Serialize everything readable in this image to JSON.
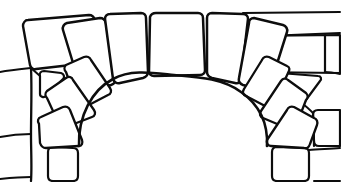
{
  "figure": {
    "width": 341,
    "height": 182,
    "background_color": "#ffffff",
    "stroke_color": "#0d0d0d",
    "stroke_width": 2.1,
    "medium": "pen-and-ink line art"
  },
  "shapes": {
    "arch_voussoirs": [
      {
        "name": "voussoir-keystone",
        "label": "keystone",
        "position": "top-center",
        "path": "M150 17 C151 14 153 13 156 13 L198 13 C201 13 203 15 203 18 L205 70 C205 73 203 75 200 75 L154 76 C151 76 149 74 149 71 Z"
      },
      {
        "name": "voussoir-left-1",
        "label": "upper-left voussoir",
        "position": "top-left-of-keystone",
        "path": "M105 19 C105 16 107 14 110 14 L141 13 C144 13 146 15 146 18 L148 72 C148 75 146 77 143 78 L120 83 C117 84 114 82 113 79 Z"
      },
      {
        "name": "voussoir-left-2",
        "label": "second-left voussoir",
        "position": "upper-left-haunch",
        "path": "M63 30 C62 27 64 24 67 23 L100 18 C103 18 105 20 106 23 L115 79 C116 82 114 84 111 85 L87 90 C84 91 81 89 80 86 Z"
      },
      {
        "name": "voussoir-left-3",
        "label": "third-left voussoir",
        "position": "left-haunch",
        "path": "M66 72 C64 70 64 67 66 65 L84 57 C87 56 90 57 91 60 L110 88 C112 91 111 94 108 95 L85 107 C82 109 79 108 78 105 Z"
      },
      {
        "name": "voussoir-left-4",
        "label": "fourth-left voussoir",
        "position": "lower-left-haunch",
        "path": "M47 98 C45 96 45 93 47 91 L66 78 C69 76 72 77 73 80 L94 110 C96 113 95 116 92 117 L66 127 C63 128 60 127 59 124 Z"
      },
      {
        "name": "voussoir-left-5",
        "label": "left springer",
        "position": "left-spring-line",
        "path": "M39 124 C37 121 38 118 41 117 L63 107 C66 106 69 107 70 110 L82 140 C83 143 82 146 79 146 L46 148 C43 148 41 146 40 143 Z"
      },
      {
        "name": "voussoir-right-1",
        "label": "upper-right voussoir",
        "position": "top-right-of-keystone",
        "path": "M207 18 C207 15 209 13 212 13 L243 14 C246 14 248 16 248 19 L241 79 C240 82 238 84 235 83 L212 78 C209 77 207 75 207 72 Z"
      },
      {
        "name": "voussoir-right-2",
        "label": "second-right voussoir",
        "position": "upper-right-haunch",
        "path": "M249 23 C249 20 251 18 254 18 L283 25 C286 26 288 29 287 32 L270 86 C269 89 266 91 263 90 L243 85 C240 84 238 81 239 78 Z"
      },
      {
        "name": "voussoir-right-3",
        "label": "third-right voussoir",
        "position": "right-haunch",
        "path": "M262 60 C263 57 266 56 269 57 L287 66 C290 67 290 70 288 73 L274 104 C273 107 270 108 267 107 L246 96 C243 95 242 92 244 89 Z"
      },
      {
        "name": "voussoir-right-4",
        "label": "fourth-right voussoir",
        "position": "lower-right-haunch",
        "path": "M281 81 C283 78 286 78 288 80 L306 93 C308 95 308 98 306 100 L296 126 C295 129 292 130 289 129 L263 118 C260 117 259 114 261 111 Z"
      },
      {
        "name": "voussoir-right-5",
        "label": "right springer",
        "position": "right-spring-line",
        "path": "M287 110 C288 107 291 106 294 107 L314 118 C317 119 318 122 317 125 L310 144 C309 147 307 149 304 148 L271 146 C268 146 266 143 267 140 Z"
      }
    ],
    "wall_stones_left": [
      {
        "name": "wall-stone-left-large-top",
        "label": "large upper-left block",
        "path": "M23 26 C23 23 25 20 28 20 L89 15 C92 15 94 17 95 20 L101 55 C102 58 100 61 97 62 L36 69 C33 70 31 68 30 65 Z"
      },
      {
        "name": "wall-stone-left-triangle",
        "label": "small left triangular stone",
        "path": "M40 76 C39 73 41 71 44 71 L61 73 C64 74 65 77 63 79 L46 96 C44 98 40 97 40 94 Z"
      },
      {
        "name": "wall-stone-left-bottom-square",
        "label": "lower-left square stone",
        "path": "M48 152 C48 149 50 147 53 147 L73 148 C76 148 78 150 78 153 L78 176 C78 179 76 181 73 181 L53 181 C50 181 48 179 48 176 Z"
      }
    ],
    "wall_stones_right": [
      {
        "name": "wall-stone-right-top-course",
        "label": "upper-right horizontal course",
        "path": "M243 13 L340 12"
      },
      {
        "name": "wall-stone-right-block-1",
        "label": "right upper block",
        "path": "M242 37 L340 33"
      },
      {
        "name": "wall-stone-right-block-2",
        "label": "right block below course",
        "path": "M244 40 C244 38 246 36 249 36 L340 35 L340 73 L253 72 C250 72 248 70 248 67 Z"
      },
      {
        "name": "wall-stone-right-triangle",
        "label": "right downward triangular stone",
        "path": "M276 78 C275 75 277 73 280 73 L318 76 C321 76 322 79 320 81 L303 104 C301 107 297 107 296 104 Z"
      },
      {
        "name": "wall-stone-right-block-3",
        "label": "right lower block",
        "path": "M313 115 C313 112 315 110 318 110 L340 110 L340 146 L319 146 C316 146 314 144 314 141 Z"
      },
      {
        "name": "wall-stone-right-bottom",
        "label": "lower-right wide stone",
        "path": "M272 152 C272 149 274 147 277 147 L304 148 C307 148 309 150 309 153 L309 176 C309 179 307 181 304 181 L277 181 C274 181 272 179 272 176 Z"
      }
    ],
    "mortar_lines": [
      {
        "name": "mortar-line-left-vertical",
        "label": "left vertical mortar joint",
        "path": "M31 68 C32 90 31 112 31 134 C31 152 32 167 31 181"
      },
      {
        "name": "mortar-line-left-upper-horizontal",
        "label": "left upper horizontal joint",
        "path": "M0 72 C10 70 21 69 31 68"
      },
      {
        "name": "mortar-line-left-lower-horizontal",
        "label": "left lower horizontal joint",
        "path": "M0 137 C10 135 21 134 31 134"
      },
      {
        "name": "mortar-line-left-bottom-horizontal",
        "label": "left bottom horizontal joint",
        "path": "M0 179 C10 178 21 177 31 177"
      },
      {
        "name": "mortar-line-left-triangle-joint",
        "label": "joint from triangle to arch",
        "path": "M40 76 L31 68"
      },
      {
        "name": "mortar-line-right-vertical-upper",
        "label": "right upper vertical joint",
        "path": "M325 35 C325 48 325 60 325 72"
      },
      {
        "name": "mortar-line-right-vertical-lower",
        "label": "right lower vertical joint",
        "path": "M313 113 C314 128 314 142 314 146"
      },
      {
        "name": "mortar-line-right-bottom-horizontal",
        "label": "right bottom horizontal joint",
        "path": "M309 150 C318 149 329 149 340 148"
      },
      {
        "name": "mortar-line-right-upper-edge",
        "label": "right edge upper joint",
        "path": "M325 72 C330 72 335 73 340 74"
      },
      {
        "name": "mortar-line-right-tri-joint",
        "label": "joint between triangle and lower block",
        "path": "M303 104 C307 107 310 110 313 113"
      },
      {
        "name": "mortar-line-right-lower-edge",
        "label": "right edge lower joint",
        "path": "M340 181 L314 181"
      }
    ],
    "arch_intrados": {
      "name": "arch-intrados-curve",
      "label": "inner arch curve (opening)",
      "path": "M79 146 C78 116 92 90 113 79 C131 69 154 73 174 75 C197 77 222 78 241 92 C261 106 268 126 267 146"
    }
  },
  "counts": {
    "total_voussoirs": 11,
    "left_wall_stones": 3,
    "right_wall_stones": 6
  }
}
